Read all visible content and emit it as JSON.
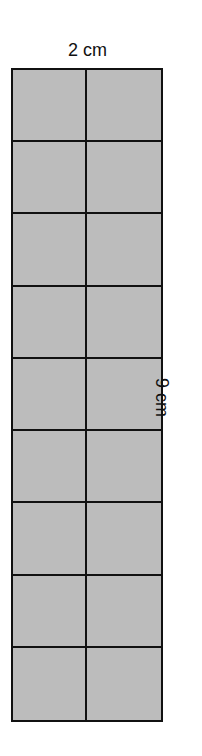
{
  "figure": {
    "width_label": "2 cm",
    "height_label": "9 cm",
    "columns": 2,
    "rows": 9,
    "fill_color": "#bcbcbc",
    "line_color": "#111111"
  }
}
